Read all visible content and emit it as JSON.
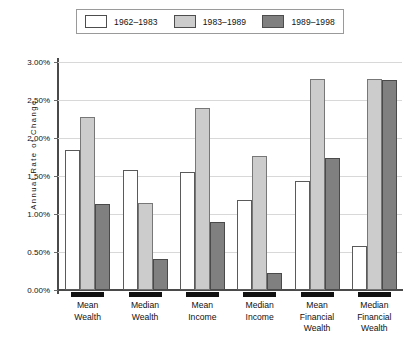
{
  "chart_data": {
    "type": "bar",
    "title": "",
    "xlabel": "",
    "ylabel": "Annual Rate of Change",
    "ylim": [
      0,
      3.0
    ],
    "ytick_values": [
      0.0,
      0.5,
      1.0,
      1.5,
      2.0,
      2.5,
      3.0
    ],
    "ytick_labels": [
      "0.00%",
      "0.50%",
      "1.00%",
      "1.50%",
      "2.00%",
      "2.50%",
      "3.00%"
    ],
    "grid": true,
    "legend_position": "top",
    "categories": [
      "Mean Wealth",
      "Median Wealth",
      "Mean Income",
      "Median Income",
      "Mean Financial Wealth",
      "Median Financial Wealth"
    ],
    "category_lines": [
      [
        "Mean",
        "Wealth"
      ],
      [
        "Median",
        "Wealth"
      ],
      [
        "Mean",
        "Income"
      ],
      [
        "Median",
        "Income"
      ],
      [
        "Mean",
        "Financial",
        "Wealth"
      ],
      [
        "Median",
        "Financial",
        "Wealth"
      ]
    ],
    "series": [
      {
        "name": "1962–1983",
        "color": "#ffffff",
        "values": [
          1.84,
          1.58,
          1.55,
          1.18,
          1.43,
          0.58
        ]
      },
      {
        "name": "1983–1989",
        "color": "#cccccc",
        "values": [
          2.27,
          1.14,
          2.4,
          1.76,
          2.77,
          2.77
        ]
      },
      {
        "name": "1989–1998",
        "color": "#808080",
        "values": [
          1.13,
          0.41,
          0.89,
          0.22,
          1.74,
          2.76
        ]
      }
    ]
  }
}
